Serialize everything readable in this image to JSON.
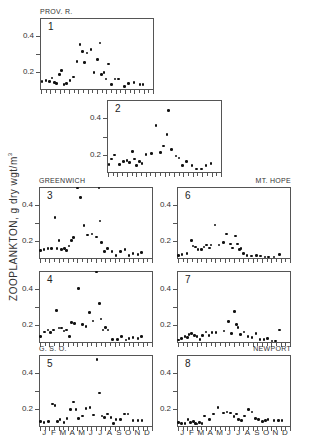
{
  "chart_data": {
    "type": "scatter",
    "title": "",
    "ylabel": "ZOOPLANKTON, g dry wgt/m³",
    "ylabel_main": "ZOOPLANKTON,  g dry wgt/m",
    "ylabel_sup": "3",
    "xlabel": "",
    "x_tick_labels": [
      "J",
      "F",
      "M",
      "A",
      "M",
      "J",
      "J",
      "A",
      "S",
      "O",
      "N",
      "D"
    ],
    "y_tick_labels": [
      "0.2",
      "0.4"
    ],
    "ylim": [
      0.11,
      0.49
    ],
    "xlim_months": [
      0,
      12
    ],
    "grid": false,
    "panels": [
      {
        "id": 1,
        "label": "1",
        "station": "PROV. R.",
        "x": [
          0.1,
          0.55,
          0.9,
          1.2,
          1.45,
          1.65,
          2.0,
          2.2,
          2.45,
          2.75,
          3.1,
          3.5,
          3.85,
          4.2,
          4.45,
          4.65,
          4.95,
          5.35,
          5.7,
          6.05,
          6.3,
          6.5,
          6.75,
          6.95,
          7.25,
          7.55,
          7.95,
          8.3,
          8.95,
          9.35,
          9.95,
          10.6,
          10.95
        ],
        "y": [
          0.15,
          0.155,
          0.15,
          0.17,
          0.145,
          0.14,
          0.19,
          0.21,
          0.135,
          0.14,
          0.155,
          0.175,
          0.26,
          0.35,
          0.315,
          0.255,
          0.305,
          0.325,
          0.2,
          0.27,
          0.36,
          0.19,
          0.2,
          0.165,
          0.245,
          0.135,
          0.165,
          0.165,
          0.125,
          0.14,
          0.145,
          0.135,
          0.135
        ]
      },
      {
        "id": 2,
        "label": "2",
        "station": "",
        "x": [
          0.1,
          0.4,
          0.7,
          1.2,
          1.65,
          2.0,
          2.3,
          2.6,
          2.8,
          3.05,
          3.35,
          3.6,
          4.05,
          4.65,
          5.1,
          5.6,
          5.9,
          6.25,
          6.45,
          6.75,
          7.2,
          7.55,
          7.9,
          8.35,
          8.9,
          9.4,
          9.9,
          10.4,
          10.95
        ],
        "y": [
          0.15,
          0.18,
          0.2,
          0.15,
          0.165,
          0.17,
          0.16,
          0.22,
          0.18,
          0.145,
          0.165,
          0.155,
          0.205,
          0.21,
          0.36,
          0.215,
          0.25,
          0.31,
          0.44,
          0.23,
          0.195,
          0.185,
          0.145,
          0.165,
          0.145,
          0.125,
          0.125,
          0.145,
          0.155
        ]
      },
      {
        "id": 3,
        "label": "3",
        "station": "GREENWICH",
        "x": [
          0.05,
          0.45,
          0.85,
          1.25,
          1.6,
          1.8,
          2.05,
          2.3,
          2.6,
          2.85,
          3.1,
          3.35,
          3.6,
          4.0,
          4.35,
          4.7,
          5.1,
          5.55,
          6.05,
          6.3,
          6.45,
          6.6,
          6.9,
          7.25,
          7.7,
          8.15,
          8.6,
          9.1,
          9.55,
          9.95,
          10.5,
          10.9
        ],
        "y": [
          0.15,
          0.155,
          0.16,
          0.16,
          0.33,
          0.16,
          0.205,
          0.155,
          0.16,
          0.15,
          0.175,
          0.205,
          0.22,
          0.49,
          0.44,
          0.285,
          0.235,
          0.24,
          0.225,
          0.49,
          0.31,
          0.195,
          0.145,
          0.16,
          0.145,
          0.125,
          0.145,
          0.155,
          0.125,
          0.135,
          0.13,
          0.14
        ]
      },
      {
        "id": 4,
        "label": "4",
        "station": "",
        "x": [
          0.05,
          0.5,
          0.85,
          1.15,
          1.45,
          1.75,
          2.05,
          2.3,
          2.55,
          2.85,
          3.15,
          3.4,
          3.7,
          4.1,
          4.55,
          4.95,
          5.3,
          5.7,
          6.05,
          6.35,
          6.55,
          6.75,
          7.0,
          7.3,
          7.75,
          8.3,
          8.75,
          9.2,
          9.55,
          9.95,
          10.5,
          10.85
        ],
        "y": [
          0.14,
          0.165,
          0.175,
          0.16,
          0.175,
          0.28,
          0.185,
          0.185,
          0.17,
          0.175,
          0.14,
          0.215,
          0.21,
          0.4,
          0.205,
          0.195,
          0.27,
          0.225,
          0.49,
          0.32,
          0.235,
          0.175,
          0.19,
          0.175,
          0.125,
          0.125,
          0.14,
          0.12,
          0.13,
          0.135,
          0.13,
          0.14
        ]
      },
      {
        "id": 5,
        "label": "5",
        "station": "G. S. O.",
        "x": [
          0.05,
          0.45,
          0.9,
          1.35,
          1.6,
          1.85,
          2.15,
          2.55,
          2.9,
          3.25,
          3.6,
          3.85,
          4.15,
          4.55,
          4.95,
          5.35,
          5.75,
          6.1,
          6.35,
          6.65,
          6.9,
          7.25,
          7.6,
          7.85,
          8.15,
          8.6,
          9.05,
          9.45,
          9.95,
          10.5,
          10.95
        ],
        "y": [
          0.135,
          0.13,
          0.135,
          0.23,
          0.22,
          0.135,
          0.145,
          0.13,
          0.15,
          0.2,
          0.24,
          0.2,
          0.15,
          0.165,
          0.205,
          0.21,
          0.17,
          0.47,
          0.29,
          0.165,
          0.155,
          0.175,
          0.155,
          0.125,
          0.145,
          0.145,
          0.175,
          0.175,
          0.14,
          0.14,
          0.14
        ]
      },
      {
        "id": 6,
        "label": "6",
        "station": "MT. HOPE",
        "x": [
          0.05,
          0.45,
          0.95,
          1.45,
          1.6,
          1.85,
          2.15,
          2.5,
          2.8,
          3.05,
          3.35,
          3.55,
          3.95,
          4.4,
          4.85,
          5.2,
          5.6,
          5.85,
          6.15,
          6.35,
          6.6,
          6.75,
          7.0,
          7.4,
          7.85,
          8.4,
          8.85,
          9.3,
          9.7,
          10.3,
          10.85
        ],
        "y": [
          0.125,
          0.13,
          0.135,
          0.205,
          0.175,
          0.17,
          0.155,
          0.155,
          0.17,
          0.18,
          0.165,
          0.18,
          0.29,
          0.18,
          0.195,
          0.24,
          0.185,
          0.165,
          0.23,
          0.185,
          0.155,
          0.16,
          0.135,
          0.125,
          0.12,
          0.125,
          0.12,
          0.115,
          0.115,
          0.115,
          0.13
        ]
      },
      {
        "id": 7,
        "label": "7",
        "station": "",
        "x": [
          0.05,
          0.4,
          0.75,
          1.0,
          1.2,
          1.45,
          1.75,
          2.05,
          2.35,
          2.65,
          3.0,
          3.3,
          3.65,
          4.05,
          4.95,
          5.4,
          5.75,
          6.05,
          6.25,
          6.45,
          6.7,
          7.05,
          7.5,
          7.95,
          8.35,
          8.8,
          9.2,
          9.6,
          10.05,
          10.45,
          10.9
        ],
        "y": [
          0.12,
          0.13,
          0.14,
          0.135,
          0.15,
          0.155,
          0.145,
          0.14,
          0.125,
          0.145,
          0.165,
          0.145,
          0.16,
          0.16,
          0.17,
          0.22,
          0.155,
          0.275,
          0.205,
          0.19,
          0.15,
          0.165,
          0.14,
          0.135,
          0.155,
          0.125,
          0.125,
          0.13,
          0.115,
          0.115,
          0.175
        ]
      },
      {
        "id": 8,
        "label": "8",
        "station": "NEWPORT",
        "x": [
          0.05,
          0.4,
          0.75,
          1.05,
          1.35,
          1.65,
          1.85,
          2.05,
          2.3,
          2.55,
          2.85,
          3.35,
          3.8,
          4.3,
          4.85,
          5.25,
          5.65,
          6.0,
          6.25,
          6.5,
          6.8,
          7.1,
          7.55,
          7.95,
          8.3,
          8.65,
          9.05,
          9.35,
          9.65,
          10.3,
          10.75,
          11.15
        ],
        "y": [
          0.13,
          0.125,
          0.125,
          0.145,
          0.13,
          0.135,
          0.125,
          0.12,
          0.13,
          0.125,
          0.165,
          0.145,
          0.175,
          0.21,
          0.18,
          0.185,
          0.18,
          0.16,
          0.175,
          0.145,
          0.14,
          0.165,
          0.2,
          0.185,
          0.15,
          0.145,
          0.135,
          0.14,
          0.145,
          0.14,
          0.14,
          0.14
        ]
      }
    ]
  }
}
